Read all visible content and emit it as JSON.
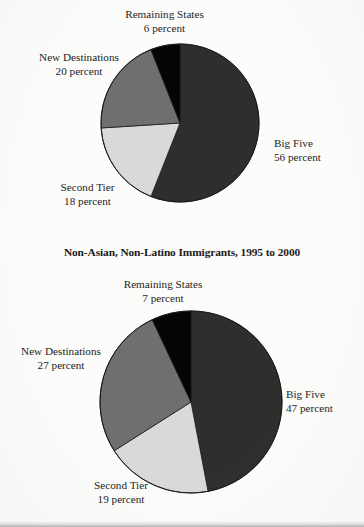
{
  "document": {
    "kind": "scanned-book-figure",
    "figure_count": 2
  },
  "charts": [
    {
      "id": "top",
      "title": "",
      "labels": {
        "remaining": {
          "name": "Remaining States",
          "pct": "6 percent"
        },
        "new": {
          "name": "New Destinations",
          "pct": "20 percent"
        },
        "big": {
          "name": "Big Five",
          "pct": "56 percent"
        },
        "second": {
          "name": "Second Tier",
          "pct": "18 percent"
        }
      }
    },
    {
      "id": "bottom",
      "title": "Non-Asian, Non-Latino Immigrants, 1995 to 2000",
      "labels": {
        "remaining": {
          "name": "Remaining States",
          "pct": "7 percent"
        },
        "new": {
          "name": "New Destinations",
          "pct": "27 percent"
        },
        "big": {
          "name": "Big Five",
          "pct": "47 percent"
        },
        "second": {
          "name": "Second Tier",
          "pct": "19 percent"
        }
      }
    }
  ],
  "colors": {
    "big_five": "#2e2e2c",
    "second_tier": "#d9d9d7",
    "new_destinations": "#6f6f6d",
    "remaining_states": "#050505",
    "slice_outline": "#1a1a18",
    "paper": "#fcfcfb",
    "text": "#242422"
  },
  "chart_data": [
    {
      "type": "pie",
      "title": "",
      "categories": [
        "Big Five",
        "Second Tier",
        "New Destinations",
        "Remaining States"
      ],
      "values": [
        56,
        18,
        20,
        6
      ],
      "value_unit": "percent",
      "colors": [
        "#2e2e2c",
        "#d9d9d7",
        "#6f6f6d",
        "#050505"
      ],
      "start_angle_deg": 0,
      "direction": "clockwise",
      "legend": "none",
      "labels_position": "outside-callout",
      "grid": false
    },
    {
      "type": "pie",
      "title": "Non-Asian, Non-Latino Immigrants, 1995 to 2000",
      "categories": [
        "Big Five",
        "Second Tier",
        "New Destinations",
        "Remaining States"
      ],
      "values": [
        47,
        19,
        27,
        7
      ],
      "value_unit": "percent",
      "colors": [
        "#2e2e2c",
        "#d9d9d7",
        "#6f6f6d",
        "#050505"
      ],
      "start_angle_deg": 0,
      "direction": "clockwise",
      "legend": "none",
      "labels_position": "outside-callout",
      "grid": false
    }
  ]
}
